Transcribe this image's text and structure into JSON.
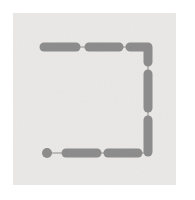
{
  "figure": {
    "title": "",
    "domain": "diagram",
    "canvas": {
      "width": 195,
      "height": 200,
      "background": "#ffffff"
    },
    "panel": {
      "name": "diagram-panel",
      "x": 13,
      "y": 13,
      "width": 163,
      "height": 172,
      "fill": "#ecebe9",
      "texture": "mottled-paper",
      "border": "none"
    },
    "style": {
      "segment_fill": "#8c8c8c",
      "segment_stroke": "#7a7a7a",
      "connector_stroke": "#8e8e8e",
      "connector_width": 1,
      "segment_thickness": 9,
      "cap": "round"
    },
    "path_description": "open rectangle (C-shape) missing the left side, traversed from a round start node at bottom-left, rightward along the bottom, up the right side, and leftward along the top",
    "nodes": [
      {
        "name": "start-node",
        "type": "dot",
        "cx": 47,
        "cy": 153,
        "r": 5,
        "fill": "#8c8c8c",
        "label": ""
      }
    ],
    "segments": [
      {
        "name": "segment-top-left",
        "type": "capsule-horizontal",
        "order": 1,
        "x1": 44,
        "y1": 47,
        "x2": 76,
        "y2": 47,
        "thickness": 9
      },
      {
        "name": "segment-top-middle",
        "type": "capsule-horizontal",
        "order": 2,
        "x1": 89,
        "y1": 47,
        "x2": 119,
        "y2": 47,
        "thickness": 9
      },
      {
        "name": "segment-top-right-elbow",
        "type": "capsule-elbow",
        "order": 3,
        "x1": 130,
        "y1": 47,
        "x2": 148,
        "y2": 47,
        "corner_x": 148,
        "corner_y": 47,
        "drop_to_y": 62,
        "thickness": 9
      },
      {
        "name": "segment-right-upper",
        "type": "capsule-vertical",
        "order": 4,
        "x1": 148,
        "y1": 74,
        "x2": 148,
        "y2": 108,
        "thickness": 9
      },
      {
        "name": "segment-right-lower",
        "type": "capsule-vertical",
        "order": 5,
        "x1": 148,
        "y1": 120,
        "x2": 148,
        "y2": 152,
        "thickness": 9
      },
      {
        "name": "segment-bottom-right",
        "type": "capsule-horizontal",
        "order": 6,
        "x1": 108,
        "y1": 153,
        "x2": 138,
        "y2": 153,
        "thickness": 9
      },
      {
        "name": "segment-bottom-left",
        "type": "capsule-horizontal",
        "order": 7,
        "x1": 66,
        "y1": 153,
        "x2": 97,
        "y2": 153,
        "thickness": 9
      }
    ],
    "connectors": [
      {
        "name": "connector-top-1",
        "x1": 76,
        "y1": 47,
        "x2": 89,
        "y2": 47
      },
      {
        "name": "connector-top-2",
        "x1": 119,
        "y1": 47,
        "x2": 130,
        "y2": 47
      },
      {
        "name": "connector-right-1",
        "x1": 148,
        "y1": 62,
        "x2": 148,
        "y2": 74
      },
      {
        "name": "connector-right-2",
        "x1": 148,
        "y1": 108,
        "x2": 148,
        "y2": 120
      },
      {
        "name": "connector-bottom-1",
        "x1": 138,
        "y1": 153,
        "x2": 148,
        "y2": 153
      },
      {
        "name": "connector-bottom-2",
        "x1": 97,
        "y1": 153,
        "x2": 108,
        "y2": 153
      },
      {
        "name": "connector-start",
        "x1": 50,
        "y1": 153,
        "x2": 66,
        "y2": 153
      }
    ]
  }
}
